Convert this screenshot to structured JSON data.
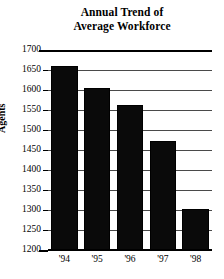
{
  "chart_data": {
    "type": "bar",
    "title": "Annual Trend of Average Workforce",
    "title_lines": [
      "Annual Trend of",
      "Average Workforce"
    ],
    "categories": [
      "'94",
      "'95",
      "'96",
      "'97",
      "'98"
    ],
    "values": [
      1660,
      1605,
      1563,
      1472,
      1303
    ],
    "series": [
      {
        "name": "Agents",
        "values": [
          1660,
          1605,
          1563,
          1472,
          1303
        ]
      }
    ],
    "xlabel": "",
    "ylabel": "Agents",
    "ylim": [
      1200,
      1700
    ],
    "ytick_values": [
      1200,
      1250,
      1300,
      1350,
      1400,
      1450,
      1500,
      1550,
      1600,
      1650,
      1700
    ],
    "ytick_labels": [
      "1200",
      "1250",
      "1300",
      "1350",
      "1400",
      "1450",
      "1500",
      "1550",
      "1600",
      "1650",
      "1700"
    ],
    "grid": true,
    "grid_axis": "y",
    "legend": false,
    "legend_position": "none",
    "bar_color": "#0a0a0a",
    "grid_color": "#4a4a4a",
    "axis_color": "#000000",
    "background_color": "#ffffff"
  }
}
